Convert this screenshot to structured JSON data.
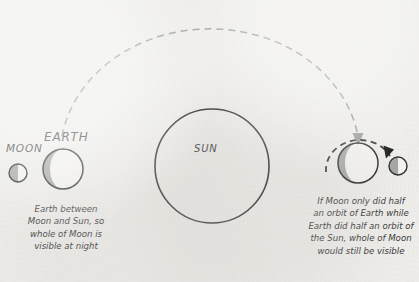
{
  "figure": {
    "background_color": "#eeedea",
    "ink_color": "#3a3a3a",
    "shade_color": "#a6a6a6",
    "lit_color": "#f4f3f0",
    "orbit_dash_color": "#9a9a9a",
    "moon_orbit_dash_color": "#2e2e2e"
  },
  "bodies": {
    "sun": {
      "label": "SUN",
      "cx": 212,
      "cy": 166,
      "r": 57,
      "fill": "none",
      "stroke": "#2e2e2e"
    },
    "earth_left": {
      "label": "EARTH",
      "cx": 63,
      "cy": 169,
      "r": 20,
      "shaded_side": "left"
    },
    "moon_left": {
      "label": "MOON",
      "cx": 18,
      "cy": 173,
      "r": 9,
      "shaded_side": "left"
    },
    "earth_right": {
      "label": "",
      "cx": 358,
      "cy": 163,
      "r": 20,
      "shaded_side": "left"
    },
    "moon_right": {
      "label": "",
      "cx": 398,
      "cy": 166,
      "r": 9,
      "shaded_side": "left"
    }
  },
  "orbits": {
    "earth_orbit": {
      "name": "earth-orbit-around-sun",
      "style": "dashed",
      "color": "#9a9a9a",
      "arrow": "down-arrow-at-right-earth"
    },
    "moon_orbit": {
      "name": "moon-orbit-around-earth",
      "style": "dashed",
      "color": "#2e2e2e",
      "arrow": "arrow-at-right-moon"
    }
  },
  "captions": {
    "left": [
      "Earth between",
      "Moon and Sun, so",
      "whole of Moon is",
      "visible at night"
    ],
    "right": [
      "If Moon only did half",
      "an orbit of Earth while",
      "Earth did half an orbit of",
      "the Sun, whole of Moon",
      "would still be visible"
    ]
  }
}
